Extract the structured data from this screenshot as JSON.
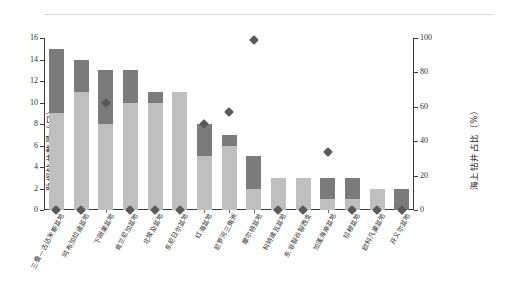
{
  "header": {
    "note": ""
  },
  "chart_data": {
    "type": "bar",
    "title": "",
    "xlabel": "",
    "ylabel": "勘探钻井数量（口）",
    "y2label": "海上钻井占比（%）",
    "ylim": [
      0,
      16
    ],
    "y2lim": [
      0,
      100
    ],
    "grid": false,
    "legend_position": "none",
    "yticks": [
      "0",
      "2",
      "4",
      "6",
      "8",
      "10",
      "12",
      "14",
      "16"
    ],
    "y2ticks": [
      "0",
      "20",
      "40",
      "60",
      "80",
      "100"
    ],
    "categories": [
      "三叠—古达米斯盆地",
      "阿布加拉迪盆地",
      "下刚果盆地",
      "肯兰尼加盆地",
      "北埃及盆地",
      "东尼日尔盆地",
      "红海盆地",
      "尼罗河三角洲",
      "摩尔特盆地",
      "科特迪瓦盆地",
      "东非裂谷裂西支",
      "加蓬海岸盆地",
      "拉穆盆地",
      "欧科凡果盆地",
      "开义尔盆地"
    ],
    "series": [
      {
        "name": "陆上钻井",
        "color": "#bfbfbf",
        "values": [
          9,
          11,
          8,
          10,
          10,
          11,
          5,
          6,
          2,
          3,
          3,
          1,
          1,
          2,
          0
        ]
      },
      {
        "name": "海上钻井",
        "color": "#7b7b7b",
        "values": [
          6,
          3,
          5,
          3,
          1,
          0,
          3,
          1,
          3,
          0,
          0,
          2,
          2,
          0,
          2
        ]
      }
    ],
    "totals": [
      15,
      14,
      13,
      13,
      11,
      11,
      8,
      7,
      5,
      3,
      3,
      3,
      3,
      2,
      2
    ],
    "marker_series": {
      "name": "海上钻井占比",
      "color": "#5a5a5a",
      "unit": "%",
      "values": [
        0,
        0,
        62,
        0,
        0,
        0,
        50,
        57,
        99,
        0,
        0,
        34,
        0,
        0,
        0
      ]
    }
  }
}
